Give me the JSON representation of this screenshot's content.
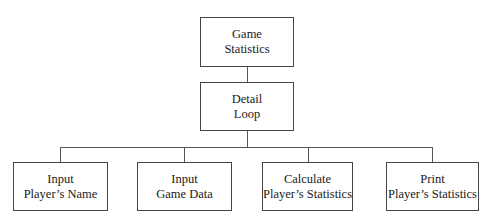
{
  "diagram": {
    "type": "hierarchy-chart",
    "root": {
      "lines": [
        "Game",
        "Statistics"
      ]
    },
    "middle": {
      "lines": [
        "Detail",
        "Loop"
      ]
    },
    "children": [
      {
        "lines": [
          "Input",
          "Player’s Name"
        ]
      },
      {
        "lines": [
          "Input",
          "Game Data"
        ]
      },
      {
        "lines": [
          "Calculate",
          "Player’s Statistics"
        ]
      },
      {
        "lines": [
          "Print",
          "Player’s Statistics"
        ]
      }
    ],
    "edges": [
      [
        "root",
        "middle"
      ],
      [
        "middle",
        "child-0"
      ],
      [
        "middle",
        "child-1"
      ],
      [
        "middle",
        "child-2"
      ],
      [
        "middle",
        "child-3"
      ]
    ]
  }
}
